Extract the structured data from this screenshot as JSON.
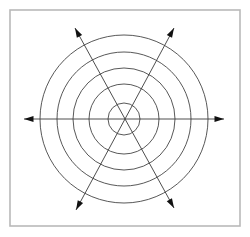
{
  "figure": {
    "background_color": "#ffffff"
  },
  "frame": {
    "name": "outer-border",
    "x": 10,
    "y": 10,
    "width": 230,
    "height": 216,
    "stroke_color": "#b9b9b9",
    "stroke_width": 1.6,
    "fill_color": "#ffffff"
  },
  "chart_data": {
    "type": "scatter",
    "subtitle": "",
    "xlabel": "",
    "ylabel": "",
    "grid": false,
    "legend": "none",
    "xlim": [
      0,
      250
    ],
    "ylim": [
      0,
      237
    ],
    "tick_labels_x": [],
    "tick_labels_y": [],
    "annotations": [],
    "center": {
      "x": 124,
      "y": 119
    },
    "circle_count": 5,
    "circle_radii": [
      16,
      35,
      51,
      67,
      84
    ],
    "circle_stroke_color": "#3a3a3a",
    "circle_stroke_width": 0.85,
    "axis_count": 3,
    "axis_angles_deg": [
      0,
      60,
      120
    ],
    "axis_stroke_color": "#3a3a3a",
    "axis_stroke_width": 0.9,
    "arrow_head_color": "#111111",
    "arrow_head_count": 6,
    "axes": [
      {
        "name": "horizontal-axis",
        "angle_deg": 0,
        "x1": 24,
        "y1": 119,
        "x2": 224,
        "y2": 119,
        "arrow_start": true,
        "arrow_end": true
      },
      {
        "name": "diagonal-axis-up-right",
        "angle_deg": 60,
        "x1": 76,
        "y1": 210,
        "x2": 174,
        "y2": 28,
        "arrow_start": true,
        "arrow_end": true
      },
      {
        "name": "diagonal-axis-up-left",
        "angle_deg": 120,
        "x1": 174,
        "y1": 208,
        "x2": 75,
        "y2": 28,
        "arrow_start": true,
        "arrow_end": true
      }
    ],
    "arrow_tips": [
      {
        "name": "arrow-tip-left",
        "x": 24,
        "y": 119
      },
      {
        "name": "arrow-tip-right",
        "x": 224,
        "y": 119
      },
      {
        "name": "arrow-tip-upper-left",
        "x": 75,
        "y": 28
      },
      {
        "name": "arrow-tip-upper-right",
        "x": 174,
        "y": 28
      },
      {
        "name": "arrow-tip-lower-left",
        "x": 76,
        "y": 210
      },
      {
        "name": "arrow-tip-lower-right",
        "x": 174,
        "y": 208
      }
    ]
  }
}
